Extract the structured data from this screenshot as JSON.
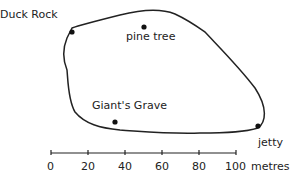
{
  "map": {
    "places": [
      {
        "name": "Duck Rock",
        "x": 72,
        "y": 32,
        "label_x": 0,
        "label_y": 9
      },
      {
        "name": "pine tree",
        "x": 144,
        "y": 27,
        "label_x": 126,
        "label_y": 33
      },
      {
        "name": "Giant's Grave",
        "x": 115,
        "y": 122,
        "label_x": 92,
        "label_y": 102
      },
      {
        "name": "jetty",
        "x": 258,
        "y": 126,
        "label_x": 258,
        "label_y": 139
      }
    ],
    "scale": {
      "ticks": [
        "0",
        "20",
        "40",
        "60",
        "80",
        "100"
      ],
      "unit": "metres"
    }
  }
}
